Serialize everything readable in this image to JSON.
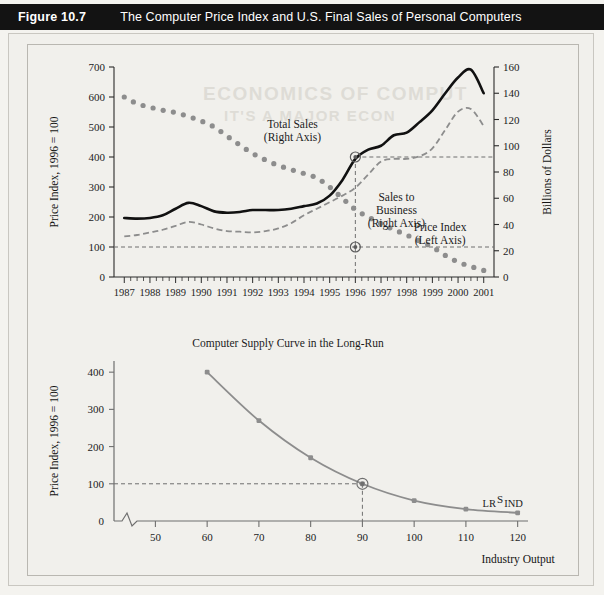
{
  "header": {
    "figure_number": "Figure 10.7",
    "title": "The Computer Price Index and U.S. Final Sales of Personal Computers"
  },
  "ghost_text": {
    "line1": "ECONOMICS OF COMPUT",
    "line2": "IT'S A MAJOR ECON"
  },
  "chart_data": [
    {
      "id": "top",
      "type": "line",
      "title": "",
      "xlabel": "",
      "ylabel": "Price Index, 1996 = 100",
      "y2label": "Billions of Dollars",
      "xlim": [
        1986.6,
        2001.4
      ],
      "ylim": [
        0,
        700
      ],
      "y2lim": [
        0,
        160
      ],
      "yticks": [
        0,
        100,
        200,
        300,
        400,
        500,
        600,
        700
      ],
      "y2ticks": [
        0,
        20,
        40,
        60,
        80,
        100,
        120,
        140,
        160
      ],
      "xticks": [
        1987,
        1988,
        1989,
        1990,
        1991,
        1992,
        1993,
        1994,
        1995,
        1996,
        1997,
        1998,
        1999,
        2000,
        2001
      ],
      "x": [
        1987,
        1987.5,
        1988,
        1988.5,
        1989,
        1989.5,
        1990,
        1990.5,
        1991,
        1991.5,
        1992,
        1992.5,
        1993,
        1993.5,
        1994,
        1994.5,
        1995,
        1995.5,
        1996,
        1996.5,
        1997,
        1997.5,
        1998,
        1998.5,
        1999,
        1999.5,
        2000,
        2000.5,
        2001
      ],
      "series": [
        {
          "name": "Price Index (Left Axis)",
          "axis": "left",
          "style": "dotted",
          "color": "#8d8d8d",
          "values": [
            600,
            578,
            566,
            556,
            548,
            535,
            520,
            500,
            470,
            440,
            412,
            390,
            372,
            358,
            345,
            330,
            300,
            262,
            225,
            200,
            178,
            158,
            140,
            120,
            100,
            72,
            50,
            35,
            22
          ],
          "label_xy": [
            1998.9,
            155
          ]
        },
        {
          "name": "Total Sales (Right Axis)",
          "axis": "right",
          "style": "solid",
          "color": "#111111",
          "values": [
            45,
            44.5,
            45,
            47,
            52,
            56.5,
            54,
            50,
            49,
            49.5,
            51,
            51,
            51,
            52,
            54,
            56,
            62,
            74,
            90,
            97,
            100,
            108,
            110,
            118,
            127,
            140,
            152,
            158,
            140
          ],
          "label_xy": [
            1993.4,
            490
          ]
        },
        {
          "name": "Sales to Business (Right Axis)",
          "axis": "right",
          "style": "dashed",
          "color": "#8d8d8d",
          "values": [
            31,
            32,
            34,
            36,
            39,
            42,
            40,
            37,
            35,
            34.5,
            34,
            35,
            37,
            41,
            47,
            52,
            57,
            62,
            68,
            78,
            88,
            90,
            90,
            92,
            98,
            112,
            126,
            128,
            115
          ],
          "label_xy": [
            1997.3,
            245
          ]
        }
      ],
      "reference_lines": {
        "vertical_x": 1996,
        "horizontal_left": 100,
        "horizontal_right": 90
      },
      "markers": [
        {
          "x": 1996,
          "y_left": 400
        },
        {
          "x": 1996,
          "y_left": 100
        }
      ],
      "annotations": [
        {
          "text": "Total Sales",
          "sub": "(Right Axis)"
        },
        {
          "text": "Sales to",
          "sub2": "Business",
          "sub": "(Right Axis)"
        },
        {
          "text": "Price Index",
          "sub": "(Left Axis)"
        }
      ]
    },
    {
      "id": "bottom",
      "type": "line",
      "title": "Computer Supply Curve in the Long-Run",
      "xlabel": "Industry Output",
      "ylabel": "Price Index, 1996 = 100",
      "xlim": [
        42,
        122
      ],
      "ylim": [
        0,
        430
      ],
      "yticks": [
        0,
        100,
        200,
        300,
        400
      ],
      "xticks": [
        50,
        60,
        70,
        80,
        90,
        100,
        110,
        120
      ],
      "curve_label": "LR",
      "curve_label_sup": "S",
      "curve_label_sub": "IND",
      "color": "#8d8d8d",
      "x": [
        60,
        70,
        80,
        90,
        100,
        110,
        120
      ],
      "values": [
        400,
        270,
        170,
        100,
        55,
        32,
        22
      ],
      "reference_lines": {
        "vertical_x": 90,
        "horizontal_y": 100
      },
      "markers": [
        {
          "x": 90,
          "y": 100
        }
      ],
      "axis_break": true
    }
  ]
}
